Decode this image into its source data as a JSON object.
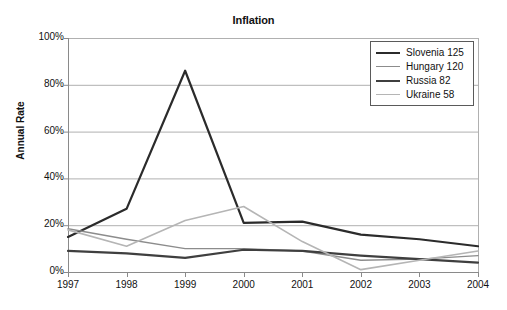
{
  "chart_data": {
    "type": "line",
    "title": "Inflation",
    "xlabel": "",
    "ylabel": "Annual Rate",
    "x": [
      1997,
      1998,
      1999,
      2000,
      2001,
      2002,
      2003,
      2004
    ],
    "categories": [
      "1997",
      "1998",
      "1999",
      "2000",
      "2001",
      "2002",
      "2003",
      "2004"
    ],
    "xlim": [
      1997,
      2004
    ],
    "ylim": [
      0,
      100
    ],
    "y_ticks": [
      0,
      20,
      40,
      60,
      80,
      100
    ],
    "y_tick_labels": [
      "0%",
      "20%",
      "40%",
      "60%",
      "80%",
      "100%"
    ],
    "grid": "horizontal",
    "legend_position": "top-right",
    "series": [
      {
        "name": "Slovenia 125",
        "label": "Slovenia 125",
        "color": "#2b2b2b",
        "width": 2.2,
        "values": [
          15,
          27,
          86,
          21,
          21.5,
          16,
          14,
          11
        ]
      },
      {
        "name": "Hungary 120",
        "label": "Hungary 120",
        "color": "#8c8c8c",
        "width": 1.4,
        "values": [
          18.5,
          14,
          10,
          10,
          9,
          5,
          5.5,
          7
        ]
      },
      {
        "name": "Russia 82",
        "label": "Russia 82",
        "color": "#3f3f3f",
        "width": 2.2,
        "values": [
          9,
          8,
          6,
          9.5,
          9,
          7,
          5.5,
          4
        ]
      },
      {
        "name": "Ukraine 58",
        "label": "Ukraine 58",
        "color": "#b5b5b5",
        "width": 1.6,
        "values": [
          18,
          11,
          22,
          28,
          13,
          1,
          5,
          9
        ]
      }
    ]
  },
  "legend": {
    "entries": [
      {
        "label": "Slovenia 125"
      },
      {
        "label": "Hungary 120"
      },
      {
        "label": "Russia 82"
      },
      {
        "label": "Ukraine 58"
      }
    ]
  },
  "axes": {
    "x_labels": [
      "1997",
      "1998",
      "1999",
      "2000",
      "2001",
      "2002",
      "2003",
      "2004"
    ],
    "y_labels": [
      "100%",
      "80%",
      "60%",
      "40%",
      "20%",
      "0%"
    ],
    "y_title": "Annual Rate"
  },
  "colors": {
    "axis": "#8a8a8a",
    "grid": "#b0b0b0",
    "text": "#111111",
    "background": "#ffffff"
  }
}
